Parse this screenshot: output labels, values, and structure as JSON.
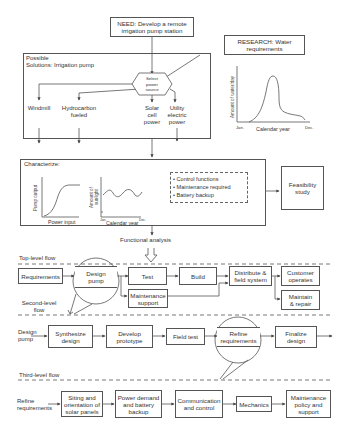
{
  "need": {
    "label": "NEED: Develop a remote irrigation pump station",
    "line1": "NEED: Develop a remote",
    "line2": "irrigation pump station"
  },
  "research": {
    "line1": "RESEARCH: Water",
    "line2": "requirements"
  },
  "solutions": {
    "title_line1": "Possible",
    "title_line2": "Solutions: Irrigation pump",
    "decision": {
      "line1": "Select",
      "line2": "power",
      "line3": "source"
    },
    "options": [
      {
        "line1": "Windmill",
        "line2": "",
        "line3": ""
      },
      {
        "line1": "Hydrocarbon",
        "line2": "fueled",
        "line3": ""
      },
      {
        "line1": "Solar",
        "line2": "cell",
        "line3": "power"
      },
      {
        "line1": "Utility",
        "line2": "electric",
        "line3": "power"
      }
    ]
  },
  "water_chart": {
    "ylabel": "Amount of water/day",
    "xlabel": "Calendar year",
    "x_start": "Jan.",
    "x_end": "Dec."
  },
  "characterize": {
    "title": "Characterize:",
    "pump_chart": {
      "ylabel": "Pump output",
      "xlabel": "Power input"
    },
    "sun_chart": {
      "ylabel_line1": "Amount of",
      "ylabel_line2": "sunlight",
      "xlabel": "Calendar year",
      "x_start": "Jan.",
      "x_end": "Dec."
    },
    "bullets": [
      "• Control functions",
      "• Maintenance required",
      "• Battery backup"
    ]
  },
  "feasibility": {
    "line1": "Feasibility",
    "line2": "study"
  },
  "functional_analysis": "Functional analysis",
  "top_level": {
    "label": "Top-level flow",
    "steps": {
      "requirements": "Requirements",
      "design_pump_1": "Design",
      "design_pump_2": "pump",
      "test": "Test",
      "build": "Build",
      "distribute_1": "Distribute &",
      "distribute_2": "field system",
      "customer_1": "Customer",
      "customer_2": "operates",
      "maintenance_1": "Maintenance",
      "maintenance_2": "support",
      "maintain_1": "Maintain",
      "maintain_2": "& repair"
    }
  },
  "second_level": {
    "label_line1": "Second-level",
    "label_line2": "flow",
    "entry_line1": "Design",
    "entry_line2": "pump",
    "steps": {
      "synth_1": "Synthesize",
      "synth_2": "design",
      "proto_1": "Develop",
      "proto_2": "prototype",
      "field": "Field test",
      "refine_1": "Refine",
      "refine_2": "requirements",
      "final_1": "Finalize",
      "final_2": "design"
    }
  },
  "third_level": {
    "label": "Third-level flow",
    "entry_line1": "Refine",
    "entry_line2": "requirements",
    "steps": {
      "siting_1": "Siting and",
      "siting_2": "orientation of",
      "siting_3": "solar panels",
      "power_1": "Power demand",
      "power_2": "and battery",
      "power_3": "backup",
      "comm_1": "Communication",
      "comm_2": "and control",
      "mech": "Mechanics",
      "maint_1": "Maintenance",
      "maint_2": "policy and",
      "maint_3": "support"
    }
  },
  "colors": {
    "line": "#555555",
    "text": "#333333",
    "background": "#ffffff"
  }
}
